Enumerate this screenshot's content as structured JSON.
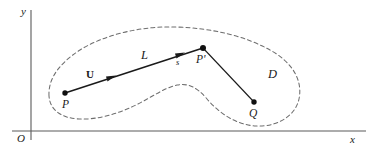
{
  "figure": {
    "kind": "math-diagram",
    "background_color": "#ffffff",
    "ink_color": "#1a1a1a",
    "axis_color": "#5a5a5a",
    "dash_color": "#6e6e6e"
  },
  "axes": {
    "origin_label": "O",
    "x_label": "x",
    "y_label": "y",
    "x_axis_y": 131,
    "y_axis_x": 31,
    "y_axis_top": 10,
    "x_axis_right": 366
  },
  "region": {
    "name_label": "D",
    "boundary_style": "dashed",
    "dash_pattern": "4 3"
  },
  "points": [
    {
      "id": "P",
      "label": "P",
      "x": 65,
      "y": 93,
      "label_x": 62,
      "label_y": 100
    },
    {
      "id": "Pp",
      "label": "P'",
      "x": 203,
      "y": 48,
      "label_x": 196,
      "label_y": 55
    },
    {
      "id": "Q",
      "label": "Q",
      "x": 254,
      "y": 102,
      "label_x": 249,
      "label_y": 109
    }
  ],
  "segments": [
    {
      "id": "L",
      "from": "P",
      "to": "Pp",
      "label": "L",
      "label_x": 141,
      "label_y": 50,
      "arrowheads": 2
    },
    {
      "id": "PQ",
      "from": "Pp",
      "to": "Q",
      "label": "",
      "arrowheads": 0
    }
  ],
  "annotations": {
    "unit_vector_label": "U",
    "unit_vector_label_x": 86,
    "unit_vector_label_y": 70,
    "arc_length_label": "s",
    "arc_length_label_x": 176,
    "arc_length_label_y": 59,
    "region_label_x": 268,
    "region_label_y": 69
  }
}
